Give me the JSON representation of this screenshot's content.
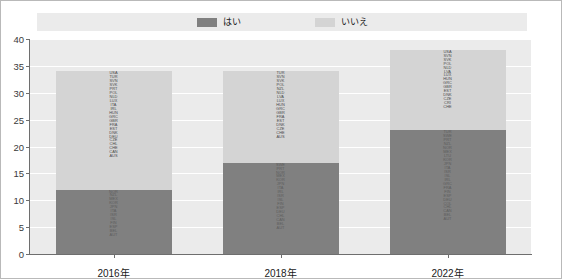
{
  "legend": {
    "items": [
      {
        "label": "はい",
        "color": "#808080",
        "name": "legend-yes"
      },
      {
        "label": "いいえ",
        "color": "#d4d4d4",
        "name": "legend-no"
      }
    ]
  },
  "axes": {
    "y_ticks": [
      "0",
      "5",
      "10",
      "15",
      "20",
      "25",
      "30",
      "35",
      "40"
    ],
    "x_ticks": [
      "2016年",
      "2018年",
      "2022年"
    ]
  },
  "chart_data": {
    "type": "bar",
    "subtype": "stacked-bar",
    "title": "",
    "xlabel": "",
    "ylabel": "",
    "ylim": [
      0,
      40
    ],
    "ytick_step": 5,
    "grid": true,
    "legend_position": "top-center",
    "categories": [
      "2016年",
      "2018年",
      "2022年"
    ],
    "series": [
      {
        "name": "はい",
        "color": "#808080",
        "values": [
          12,
          17,
          23
        ]
      },
      {
        "name": "いいえ",
        "color": "#d4d4d4",
        "values": [
          22,
          17,
          15
        ]
      }
    ],
    "totals": [
      34,
      34,
      38
    ],
    "point_labels": {
      "2016年": {
        "いいえ": [
          "USA",
          "TUR",
          "SVN",
          "SVK",
          "PRT",
          "POL",
          "NLD",
          "LUX",
          "ITA",
          "IRL",
          "HUN",
          "GRC",
          "GBR",
          "FRA",
          "EST",
          "DNK",
          "DEU",
          "CZE",
          "CHL",
          "CHE",
          "CAN",
          "AUS"
        ],
        "はい": [
          "NOR",
          "NZL",
          "MEX",
          "KOR",
          "JPN",
          "ITA",
          "ISR",
          "ISL",
          "FIN",
          "ESP",
          "BEL",
          "AUT"
        ]
      },
      "2018年": {
        "いいえ": [
          "TUR",
          "SVN",
          "SVK",
          "POL",
          "NZL",
          "NLD",
          "LVA",
          "LUX",
          "HUN",
          "GRC",
          "GBR",
          "FRA",
          "EST",
          "DNK",
          "CZE",
          "CHE",
          "AUS"
        ],
        "はい": [
          "SWE",
          "PRT",
          "NOR",
          "MEX",
          "KOR",
          "JPN",
          "ITA",
          "IRL",
          "ISR",
          "ISL",
          "FIN",
          "ESP",
          "DEU",
          "CHL",
          "CAN",
          "BEL",
          "AUT"
        ]
      },
      "2022年": {
        "いいえ": [
          "USA",
          "SVN",
          "SVK",
          "POL",
          "NLD",
          "LVA",
          "LUX",
          "HUN",
          "GRC",
          "GBR",
          "EST",
          "DNK",
          "CZE",
          "CRI",
          "CHE"
        ],
        "はい": [
          "TUR",
          "SWE",
          "PRT",
          "NZL",
          "NOR",
          "MEX",
          "LTU",
          "KOR",
          "JPN",
          "ITA",
          "ISR",
          "ISL",
          "IRL",
          "GRC",
          "FRA",
          "FIN",
          "ESP",
          "DEU",
          "COL",
          "CHL",
          "CAN",
          "BEL",
          "AUT"
        ]
      }
    }
  }
}
